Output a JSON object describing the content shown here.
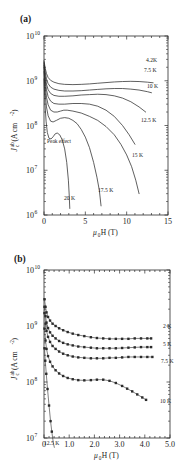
{
  "figure": {
    "background": "#ffffff",
    "line_color": "#2b2b2b",
    "caption_text": ""
  },
  "panel_a": {
    "letter": "(a)",
    "axis": {
      "xlabel_main": "H (T)",
      "xlabel_prefix": "μ",
      "xlabel_prefix_sub": "0",
      "ylabel_main": "J",
      "ylabel_sub": "c",
      "ylabel_sup": "ab",
      "ylabel_unit": "(A cm",
      "ylabel_unit_sup": "-2",
      "ylabel_unit_close": ")",
      "xticks": [
        "0",
        "5",
        "10",
        "15"
      ],
      "xtick_values": [
        0,
        5,
        10,
        15
      ],
      "xlim": [
        0,
        15
      ],
      "yticks": [
        "10",
        "10",
        "10",
        "10",
        "10"
      ],
      "ytick_exponents": [
        "6",
        "7",
        "8",
        "9",
        "10"
      ],
      "ylim_exp": [
        6,
        10
      ],
      "minor_ticks_per_decade": 9,
      "x_minor_step": 1
    },
    "annotation": {
      "peak_effect": "Peak effect"
    },
    "curve_labels": [
      {
        "text": "4.2K",
        "x": 146,
        "y": 62
      },
      {
        "text": "7.5 K",
        "x": 144,
        "y": 72
      },
      {
        "text": "10 K",
        "x": 147,
        "y": 88
      },
      {
        "text": "12.5 K",
        "x": 141,
        "y": 122
      },
      {
        "text": "15 K",
        "x": 132,
        "y": 157
      },
      {
        "text": "17.5 K",
        "x": 98,
        "y": 192
      },
      {
        "text": "20 K",
        "x": 64,
        "y": 200
      }
    ]
  },
  "panel_b": {
    "letter": "(b)",
    "axis": {
      "xlabel_main": "H (T)",
      "xlabel_prefix": "μ",
      "xlabel_prefix_sub": "0",
      "ylabel_main": "J",
      "ylabel_sub": "c",
      "ylabel_sup": "ab",
      "ylabel_unit": "(A cm",
      "ylabel_unit_sup": "-2",
      "ylabel_unit_close": ")",
      "xticks": [
        "0",
        "1.0",
        "2.0",
        "3.0",
        "4.0",
        "5.0"
      ],
      "xtick_values": [
        0,
        1,
        2,
        3,
        4,
        5
      ],
      "xlim": [
        0,
        5
      ],
      "yticks": [
        "10",
        "10",
        "10",
        "10"
      ],
      "ytick_exponents": [
        "7",
        "8",
        "9",
        "10"
      ],
      "ylim_exp": [
        7,
        10
      ],
      "minor_ticks_per_decade": 9,
      "x_minor_step": 0.2
    },
    "curve_labels": [
      {
        "text": "2 K",
        "x": 163,
        "y": 80
      },
      {
        "text": "5 K",
        "x": 163,
        "y": 98
      },
      {
        "text": "7.5 K",
        "x": 161,
        "y": 115
      },
      {
        "text": "10 K",
        "x": 160,
        "y": 155
      },
      {
        "text": "12.5 K",
        "x": 44,
        "y": 197
      }
    ]
  },
  "chart_data": [
    {
      "type": "line",
      "panel": "(a)",
      "title": "",
      "xlabel": "mu0 H (T)",
      "ylabel": "Jc^ab (A cm^-2)",
      "xlim": [
        0,
        15
      ],
      "ylim": [
        1000000.0,
        10000000000.0
      ],
      "yscale": "log",
      "grid": false,
      "legend": "inline curve labels at right",
      "annotations": [
        "Peak effect"
      ],
      "series": [
        {
          "name": "4.2K",
          "x": [
            0.0,
            0.15,
            0.3,
            0.5,
            0.8,
            1.2,
            1.8,
            2.5,
            3.5,
            4.5,
            5.5,
            6.5,
            7.5,
            8.5,
            9.5,
            10.5,
            11.5,
            12.5,
            13.2
          ],
          "y": [
            2800000000.0,
            1900000000.0,
            1450000000.0,
            1180000000.0,
            1020000000.0,
            930000000.0,
            860000000.0,
            830000000.0,
            820000000.0,
            830000000.0,
            850000000.0,
            880000000.0,
            910000000.0,
            940000000.0,
            960000000.0,
            970000000.0,
            960000000.0,
            930000000.0,
            900000000.0
          ]
        },
        {
          "name": "7.5 K",
          "x": [
            0.0,
            0.15,
            0.3,
            0.5,
            0.8,
            1.2,
            1.8,
            2.5,
            3.5,
            4.5,
            5.5,
            6.5,
            7.5,
            8.5,
            9.5,
            10.5,
            11.5,
            12.5,
            13.0
          ],
          "y": [
            2600000000.0,
            1550000000.0,
            1100000000.0,
            860000000.0,
            720000000.0,
            650000000.0,
            610000000.0,
            590000000.0,
            590000000.0,
            600000000.0,
            620000000.0,
            640000000.0,
            660000000.0,
            670000000.0,
            670000000.0,
            650000000.0,
            620000000.0,
            570000000.0,
            540000000.0
          ]
        },
        {
          "name": "10 K",
          "x": [
            0.0,
            0.15,
            0.3,
            0.5,
            0.8,
            1.2,
            1.8,
            2.5,
            3.5,
            4.5,
            5.5,
            6.5,
            7.5,
            8.5,
            9.5,
            10.5,
            11.5,
            12.3
          ],
          "y": [
            2400000000.0,
            1250000000.0,
            840000000.0,
            630000000.0,
            520000000.0,
            470000000.0,
            450000000.0,
            450000000.0,
            460000000.0,
            480000000.0,
            490000000.0,
            500000000.0,
            490000000.0,
            460000000.0,
            410000000.0,
            340000000.0,
            260000000.0,
            200000000.0
          ]
        },
        {
          "name": "12.5 K",
          "x": [
            0.0,
            0.15,
            0.3,
            0.5,
            0.8,
            1.2,
            1.8,
            2.5,
            3.5,
            4.5,
            5.5,
            6.5,
            7.5,
            8.5,
            9.5,
            10.3,
            11.0
          ],
          "y": [
            2200000000.0,
            1000000000.0,
            630000000.0,
            440000000.0,
            350000000.0,
            310000000.0,
            300000000.0,
            300000000.0,
            310000000.0,
            310000000.0,
            300000000.0,
            270000000.0,
            220000000.0,
            160000000.0,
            100000000.0,
            62000000.0,
            38000000.0
          ]
        },
        {
          "name": "15 K",
          "x": [
            0.0,
            0.15,
            0.3,
            0.5,
            0.8,
            1.2,
            1.6,
            2.0,
            2.4,
            2.8,
            3.5,
            4.5,
            5.5,
            6.5,
            7.5,
            8.5,
            9.3,
            10.0,
            10.6,
            11.1,
            11.5
          ],
          "y": [
            2000000000.0,
            750000000.0,
            430000000.0,
            290000000.0,
            220000000.0,
            200000000.0,
            200000000.0,
            210000000.0,
            220000000.0,
            220000000.0,
            210000000.0,
            190000000.0,
            160000000.0,
            130000000.0,
            95000000.0,
            62000000.0,
            38000000.0,
            22000000.0,
            12000000.0,
            6000000.0,
            3000000.0
          ]
        },
        {
          "name": "17.5 K",
          "x": [
            0.0,
            0.15,
            0.3,
            0.5,
            0.8,
            1.1,
            1.5,
            2.0,
            2.5,
            3.0,
            3.5,
            4.0,
            4.5,
            5.0,
            5.5,
            6.0,
            6.4,
            6.7,
            6.9
          ],
          "y": [
            1600000000.0,
            500000000.0,
            260000000.0,
            165000000.0,
            125000000.0,
            120000000.0,
            130000000.0,
            145000000.0,
            150000000.0,
            145000000.0,
            130000000.0,
            110000000.0,
            82000000.0,
            55000000.0,
            32000000.0,
            15000000.0,
            7000000.0,
            3500000.0,
            1600000.0
          ]
        },
        {
          "name": "20 K",
          "x": [
            0.0,
            0.12,
            0.25,
            0.4,
            0.6,
            0.85,
            1.1,
            1.35,
            1.6,
            1.9,
            2.2,
            2.5,
            2.75,
            2.95,
            3.05,
            3.12
          ],
          "y": [
            1100000000.0,
            300000000.0,
            125000000.0,
            70000000.0,
            52000000.0,
            50000000.0,
            56000000.0,
            65000000.0,
            68000000.0,
            62000000.0,
            48000000.0,
            30000000.0,
            15000000.0,
            6000000.0,
            2800000.0,
            1400000.0
          ]
        }
      ]
    },
    {
      "type": "line",
      "panel": "(b)",
      "title": "",
      "xlabel": "mu0 H (T)",
      "ylabel": "Jc^ab (A cm^-2)",
      "xlim": [
        0,
        5
      ],
      "ylim": [
        10000000.0,
        10000000000.0
      ],
      "yscale": "log",
      "grid": false,
      "markers": "filled squares",
      "legend": "inline curve labels at right",
      "series": [
        {
          "name": "2 K",
          "x": [
            0.02,
            0.06,
            0.1,
            0.16,
            0.24,
            0.34,
            0.46,
            0.6,
            0.76,
            0.94,
            1.14,
            1.36,
            1.6,
            1.86,
            2.1,
            2.35,
            2.6,
            2.85,
            3.1,
            3.35,
            3.6,
            3.85,
            4.1,
            4.25
          ],
          "y": [
            3000000000.0,
            2200000000.0,
            1750000000.0,
            1450000000.0,
            1250000000.0,
            1100000000.0,
            1000000000.0,
            910000000.0,
            840000000.0,
            780000000.0,
            730000000.0,
            690000000.0,
            660000000.0,
            630000000.0,
            610000000.0,
            600000000.0,
            590000000.0,
            590000000.0,
            590000000.0,
            590000000.0,
            600000000.0,
            600000000.0,
            600000000.0,
            600000000.0
          ]
        },
        {
          "name": "5 K",
          "x": [
            0.02,
            0.06,
            0.1,
            0.16,
            0.24,
            0.34,
            0.46,
            0.6,
            0.76,
            0.94,
            1.14,
            1.36,
            1.6,
            1.86,
            2.1,
            2.35,
            2.6,
            2.85,
            3.1,
            3.35,
            3.6,
            3.85,
            4.1,
            4.25
          ],
          "y": [
            2200000000.0,
            1500000000.0,
            1150000000.0,
            920000000.0,
            770000000.0,
            670000000.0,
            600000000.0,
            540000000.0,
            500000000.0,
            470000000.0,
            450000000.0,
            430000000.0,
            420000000.0,
            410000000.0,
            400000000.0,
            400000000.0,
            400000000.0,
            400000000.0,
            405000000.0,
            410000000.0,
            415000000.0,
            420000000.0,
            420000000.0,
            420000000.0
          ]
        },
        {
          "name": "7.5 K",
          "x": [
            0.02,
            0.06,
            0.1,
            0.16,
            0.24,
            0.34,
            0.46,
            0.6,
            0.76,
            0.94,
            1.14,
            1.36,
            1.6,
            1.86,
            2.1,
            2.35,
            2.6,
            2.85,
            3.1,
            3.35,
            3.6,
            3.85,
            4.1,
            4.3
          ],
          "y": [
            1700000000.0,
            1100000000.0,
            820000000.0,
            640000000.0,
            520000000.0,
            440000000.0,
            390000000.0,
            350000000.0,
            320000000.0,
            300000000.0,
            285000000.0,
            275000000.0,
            270000000.0,
            265000000.0,
            265000000.0,
            265000000.0,
            270000000.0,
            270000000.0,
            275000000.0,
            280000000.0,
            280000000.0,
            280000000.0,
            280000000.0,
            280000000.0
          ]
        },
        {
          "name": "10 K",
          "x": [
            0.02,
            0.06,
            0.1,
            0.16,
            0.24,
            0.34,
            0.46,
            0.6,
            0.76,
            0.94,
            1.14,
            1.36,
            1.6,
            1.86,
            2.1,
            2.35,
            2.6,
            2.85,
            3.1,
            3.3,
            3.5,
            3.7,
            3.9,
            4.05
          ],
          "y": [
            900000000.0,
            550000000.0,
            390000000.0,
            290000000.0,
            230000000.0,
            190000000.0,
            162000000.0,
            142000000.0,
            128000000.0,
            118000000.0,
            112000000.0,
            108000000.0,
            107000000.0,
            108000000.0,
            110000000.0,
            110000000.0,
            105000000.0,
            96000000.0,
            85000000.0,
            76000000.0,
            68000000.0,
            60000000.0,
            53000000.0,
            48000000.0
          ]
        },
        {
          "name": "12.5 K",
          "x": [
            0.02,
            0.05,
            0.09,
            0.14,
            0.2,
            0.26,
            0.31,
            0.35,
            0.38,
            0.41
          ],
          "y": [
            400000000.0,
            240000000.0,
            140000000.0,
            75000000.0,
            38000000.0,
            20000000.0,
            13000000.0,
            9500000.0,
            7800000.0,
            6800000.0
          ]
        }
      ]
    }
  ]
}
